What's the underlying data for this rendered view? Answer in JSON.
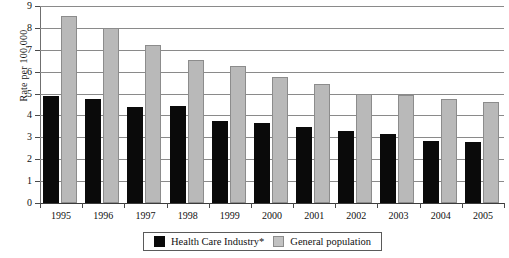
{
  "chart_data": {
    "type": "bar",
    "title": "",
    "xlabel": "",
    "ylabel": "Rate per 100,000",
    "ylim": [
      0,
      9
    ],
    "ytick_step": 1,
    "yticks": [
      "9",
      "8",
      "7",
      "6",
      "5",
      "4",
      "3",
      "2",
      "1",
      "0"
    ],
    "grid": true,
    "legend_position": "bottom-center",
    "categories": [
      "1995",
      "1996",
      "1997",
      "1998",
      "1999",
      "2000",
      "2001",
      "2002",
      "2003",
      "2004",
      "2005"
    ],
    "series": [
      {
        "name": "Health Care Industry*",
        "color": "#0a0a0a",
        "values": [
          4.9,
          4.75,
          4.4,
          4.45,
          3.75,
          3.65,
          3.45,
          3.3,
          3.15,
          2.85,
          2.8
        ]
      },
      {
        "name": "General population",
        "color": "#b9b9b9",
        "values": [
          8.55,
          8.0,
          7.2,
          6.55,
          6.25,
          5.75,
          5.45,
          5.0,
          4.95,
          4.75,
          4.6
        ]
      }
    ]
  },
  "legend": {
    "items": [
      {
        "label": "Health Care Industry*",
        "swatch": "black"
      },
      {
        "label": "General population",
        "swatch": "gray"
      }
    ]
  }
}
